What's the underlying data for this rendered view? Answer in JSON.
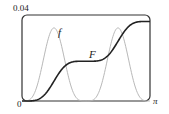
{
  "chart_data": {
    "type": "line",
    "title": "",
    "xlabel": "",
    "ylabel": "",
    "xlim": [
      0,
      3.14159
    ],
    "ylim": [
      0,
      0.04
    ],
    "x_tick_labels": [
      "0",
      "π"
    ],
    "y_tick_labels": [
      "0",
      "0.04"
    ],
    "grid": false,
    "legend": "inline labels",
    "series": [
      {
        "name": "f",
        "color": "#b8b8b8",
        "description": "two bumps peaking near x≈0.67 and x≈2.47, height ≈0.034, zero near 0, π/2 region, π",
        "x": [
          0,
          0.3,
          0.5,
          0.67,
          0.85,
          1.05,
          1.25,
          1.57,
          1.9,
          2.1,
          2.3,
          2.47,
          2.65,
          2.85,
          3.14
        ],
        "y": [
          0,
          0.01,
          0.027,
          0.034,
          0.027,
          0.01,
          0.001,
          0,
          0.001,
          0.01,
          0.027,
          0.034,
          0.027,
          0.01,
          0
        ]
      },
      {
        "name": "F",
        "color": "#222222",
        "description": "cumulative S-curve with plateau in middle",
        "x": [
          0,
          0.3,
          0.5,
          0.67,
          0.85,
          1.05,
          1.25,
          1.57,
          1.9,
          2.1,
          2.3,
          2.47,
          2.65,
          2.85,
          3.14
        ],
        "y": [
          0,
          0.002,
          0.007,
          0.012,
          0.016,
          0.0185,
          0.019,
          0.019,
          0.0195,
          0.021,
          0.026,
          0.031,
          0.035,
          0.0365,
          0.037
        ]
      }
    ]
  },
  "labels": {
    "y_top": "0.04",
    "origin": "0",
    "x_right": "π",
    "f": "f",
    "F": "F"
  }
}
